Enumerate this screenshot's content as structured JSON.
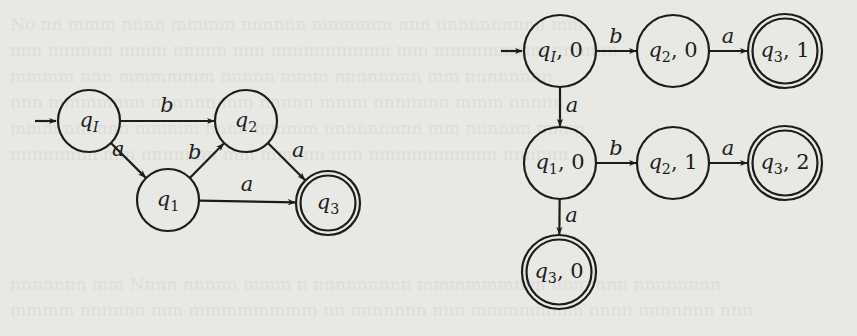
{
  "figure": {
    "background_color": "#e8e8e5",
    "stroke_color": "#1c1c1c"
  },
  "left_automaton": {
    "initial_state": "qI",
    "nodes": [
      {
        "id": "qI",
        "label_main": "q",
        "label_sub": "I",
        "suffix": "",
        "x": 89,
        "y": 121,
        "accepting": false
      },
      {
        "id": "q2",
        "label_main": "q",
        "label_sub": "2",
        "suffix": "",
        "x": 246,
        "y": 121,
        "accepting": false
      },
      {
        "id": "q1",
        "label_main": "q",
        "label_sub": "1",
        "suffix": "",
        "x": 168,
        "y": 200,
        "accepting": false
      },
      {
        "id": "q3",
        "label_main": "q",
        "label_sub": "3",
        "suffix": "",
        "x": 328,
        "y": 203,
        "accepting": true
      }
    ],
    "edges": [
      {
        "from": "qI",
        "to": "q2",
        "label": "b"
      },
      {
        "from": "qI",
        "to": "q1",
        "label": "a"
      },
      {
        "from": "q1",
        "to": "q2",
        "label": "b"
      },
      {
        "from": "q2",
        "to": "q3",
        "label": "a"
      },
      {
        "from": "q1",
        "to": "q3",
        "label": "a"
      }
    ]
  },
  "right_automaton": {
    "initial_state": "qI,0",
    "nodes": [
      {
        "id": "qI,0",
        "label_main": "q",
        "label_sub": "I",
        "suffix": ", 0",
        "x": 560,
        "y": 51,
        "accepting": false
      },
      {
        "id": "q2,0",
        "label_main": "q",
        "label_sub": "2",
        "suffix": ", 0",
        "x": 673,
        "y": 51,
        "accepting": false
      },
      {
        "id": "q3,1",
        "label_main": "q",
        "label_sub": "3",
        "suffix": ", 1",
        "x": 785,
        "y": 51,
        "accepting": true
      },
      {
        "id": "q1,0",
        "label_main": "q",
        "label_sub": "1",
        "suffix": ", 0",
        "x": 560,
        "y": 163,
        "accepting": false
      },
      {
        "id": "q2,1",
        "label_main": "q",
        "label_sub": "2",
        "suffix": ", 1",
        "x": 673,
        "y": 163,
        "accepting": false
      },
      {
        "id": "q3,2",
        "label_main": "q",
        "label_sub": "3",
        "suffix": ", 2",
        "x": 785,
        "y": 163,
        "accepting": true
      },
      {
        "id": "q3,0",
        "label_main": "q",
        "label_sub": "3",
        "suffix": ", 0",
        "x": 559,
        "y": 272,
        "accepting": true
      }
    ],
    "edges": [
      {
        "from": "qI,0",
        "to": "q2,0",
        "label": "b"
      },
      {
        "from": "q2,0",
        "to": "q3,1",
        "label": "a"
      },
      {
        "from": "qI,0",
        "to": "q1,0",
        "label": "a"
      },
      {
        "from": "q1,0",
        "to": "q2,1",
        "label": "b"
      },
      {
        "from": "q2,1",
        "to": "q3,2",
        "label": "a"
      },
      {
        "from": "q1,0",
        "to": "q3,0",
        "label": "a"
      }
    ]
  }
}
